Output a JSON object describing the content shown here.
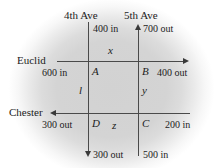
{
  "diagram": {
    "type": "traffic-flow-network",
    "streets": {
      "horizontal": [
        {
          "name": "Euclid",
          "direction": "eastbound",
          "arrow": "right"
        },
        {
          "name": "Chester",
          "direction": "westbound",
          "arrow": "left"
        }
      ],
      "vertical": [
        {
          "name": "4th Ave",
          "direction": "southbound",
          "arrow": "down"
        },
        {
          "name": "5th Ave",
          "direction": "northbound",
          "arrow": "up"
        }
      ]
    },
    "nodes": [
      {
        "id": "A",
        "position": "euclid-4th"
      },
      {
        "id": "B",
        "position": "euclid-5th"
      },
      {
        "id": "C",
        "position": "chester-5th"
      },
      {
        "id": "D",
        "position": "chester-4th"
      }
    ],
    "variables": [
      {
        "name": "x",
        "segment": "euclid-between-A-and-B"
      },
      {
        "name": "l",
        "segment": "4th-ave-between-A-and-D"
      },
      {
        "name": "y",
        "segment": "5th-ave-between-B-and-C"
      },
      {
        "name": "z",
        "segment": "chester-between-D-and-C"
      }
    ],
    "flows": [
      {
        "label": "400 in",
        "at": "4th-ave-top",
        "kind": "in"
      },
      {
        "label": "700 out",
        "at": "5th-ave-top",
        "kind": "out"
      },
      {
        "label": "600 in",
        "at": "euclid-west",
        "kind": "in"
      },
      {
        "label": "400 out",
        "at": "euclid-east",
        "kind": "out"
      },
      {
        "label": "300 out",
        "at": "chester-west",
        "kind": "out"
      },
      {
        "label": "200 in",
        "at": "chester-east",
        "kind": "in"
      },
      {
        "label": "300 out",
        "at": "4th-ave-bottom",
        "kind": "out"
      },
      {
        "label": "500 in",
        "at": "5th-ave-bottom",
        "kind": "in"
      }
    ]
  },
  "labels": {
    "ave_4th": "4th Ave",
    "ave_5th": "5th Ave",
    "top_4th_flow": "400 in",
    "top_5th_flow": "700 out",
    "euclid": "Euclid",
    "euclid_in": "600 in",
    "euclid_out": "400 out",
    "chester": "Chester",
    "chester_out": "300 out",
    "chester_in": "200 in",
    "bottom_4th_flow": "300 out",
    "bottom_5th_flow": "500 in",
    "node_a": "A",
    "node_b": "B",
    "node_c": "C",
    "node_d": "D",
    "var_x": "x",
    "var_l": "l",
    "var_y": "y",
    "var_z": "z"
  },
  "colors": {
    "line": "#4a4a4a",
    "text": "#1c1c1c",
    "background": "#d4d4d4",
    "page": "#ffffff"
  }
}
